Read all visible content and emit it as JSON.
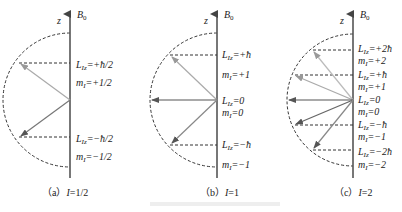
{
  "figure": {
    "panels": [
      {
        "id": "a",
        "caption_prefix": "（a）",
        "caption_var": "I",
        "caption_value": "=1/2",
        "axis_label": "z",
        "field_label": "B",
        "field_sub": "0",
        "states": [
          {
            "Lz": "L",
            "Lz_sub": "Iz",
            "Lz_value": "=+ħ/2",
            "m": "m",
            "m_sub": "I",
            "m_value": "=+1/2"
          },
          {
            "Lz": "L",
            "Lz_sub": "Iz",
            "Lz_value": "=−ħ/2",
            "m": "m",
            "m_sub": "I",
            "m_value": "=−1/2"
          }
        ]
      },
      {
        "id": "b",
        "caption_prefix": "（b）",
        "caption_var": "I",
        "caption_value": "=1",
        "axis_label": "z",
        "field_label": "B",
        "field_sub": "0",
        "states": [
          {
            "Lz": "L",
            "Lz_sub": "Iz",
            "Lz_value": "=+ħ",
            "m": "m",
            "m_sub": "I",
            "m_value": "=+1"
          },
          {
            "Lz": "L",
            "Lz_sub": "Iz",
            "Lz_value": "=0",
            "m": "m",
            "m_sub": "I",
            "m_value": "=0"
          },
          {
            "Lz": "L",
            "Lz_sub": "Iz",
            "Lz_value": "=−ħ",
            "m": "m",
            "m_sub": "I",
            "m_value": "=−1"
          }
        ]
      },
      {
        "id": "c",
        "caption_prefix": "（c）",
        "caption_var": "I",
        "caption_value": "=2",
        "axis_label": "z",
        "field_label": "B",
        "field_sub": "0",
        "states": [
          {
            "Lz": "L",
            "Lz_sub": "Iz",
            "Lz_value": "=+2ħ",
            "m": "m",
            "m_sub": "I",
            "m_value": "=+2"
          },
          {
            "Lz": "L",
            "Lz_sub": "Iz",
            "Lz_value": "=+ħ",
            "m": "m",
            "m_sub": "I",
            "m_value": "=+1"
          },
          {
            "Lz": "L",
            "Lz_sub": "Iz",
            "Lz_value": "=0",
            "m": "m",
            "m_sub": "I",
            "m_value": "=0"
          },
          {
            "Lz": "L",
            "Lz_sub": "Iz",
            "Lz_value": "=−ħ",
            "m": "m",
            "m_sub": "I",
            "m_value": "=−1"
          },
          {
            "Lz": "L",
            "Lz_sub": "Iz",
            "Lz_value": "=−2ħ",
            "m": "m",
            "m_sub": "I",
            "m_value": "=−2"
          }
        ]
      }
    ],
    "colors": {
      "axis": "#555555",
      "vector_up": "#aaaaaa",
      "vector_mid": "#666666",
      "vector_down": "#888888",
      "dashed": "#333333"
    }
  }
}
